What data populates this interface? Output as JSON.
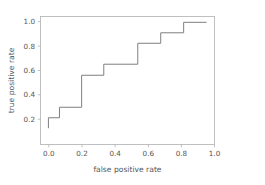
{
  "figure": {
    "background_color": "#ffffff",
    "axes_background_color": "#ffffff",
    "spine_color": "#b0b0b0",
    "tick_label_color": "#555555"
  },
  "chart_data": {
    "type": "line",
    "title": "",
    "xlabel": "false positive rate",
    "ylabel": "true positive rate",
    "xlim": [
      -0.05,
      1.05
    ],
    "ylim": [
      -0.05,
      1.05
    ],
    "grid": false,
    "legend": null,
    "line_color": "#7f7f7f",
    "drawstyle": "steps-post",
    "xticks": [
      0.0,
      0.2,
      0.4,
      0.6,
      0.8,
      1.0
    ],
    "yticks": [
      0.2,
      0.4,
      0.6,
      0.8,
      1.0
    ],
    "xticklabels": [
      "0.0",
      "0.2",
      "0.4",
      "0.6",
      "0.8",
      "1.0"
    ],
    "yticklabels": [
      "0.2",
      "0.4",
      "0.6",
      "0.8",
      "1.0"
    ],
    "series": [
      {
        "name": "roc-curve",
        "x": [
          0.0,
          0.0,
          0.07,
          0.07,
          0.21,
          0.21,
          0.35,
          0.35,
          0.565,
          0.565,
          0.71,
          0.71,
          0.855,
          0.855,
          1.0
        ],
        "y": [
          0.09,
          0.18,
          0.18,
          0.27,
          0.27,
          0.545,
          0.545,
          0.64,
          0.64,
          0.82,
          0.82,
          0.91,
          0.91,
          1.0,
          1.0
        ]
      }
    ]
  }
}
